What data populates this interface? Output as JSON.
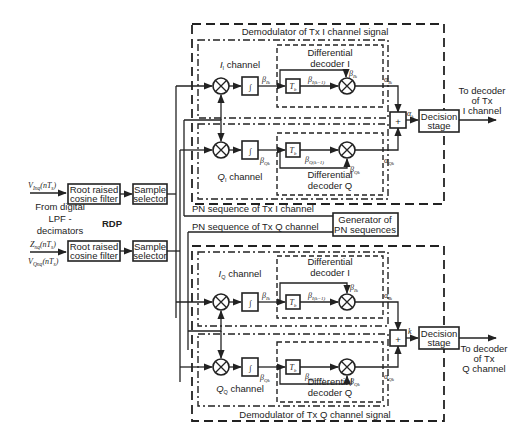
{
  "inputs": {
    "v_in": "V",
    "v_in_sub": "Inq",
    "v_in_arg": "(nT",
    "v_in_s": "s",
    "z_in": "Z",
    "z_in_sub": "nq",
    "v_q": "V",
    "v_q_sub": "Qnq",
    "source_line1": "From digital",
    "source_line2": "LPF -",
    "source_line3": "decimators"
  },
  "blocks": {
    "rrc_top_line1": "Root raised",
    "rrc_top_line2": "cosine filter",
    "rrc_bot_line1": "Root raised",
    "rrc_bot_line2": "cosine filter",
    "sel_top_line1": "Sample",
    "sel_top_line2": "selector",
    "sel_bot_line1": "Sample",
    "sel_bot_line2": "selector",
    "rdp": "RDP",
    "pn_gen_line1": "Generator of",
    "pn_gen_line2": "PN sequences",
    "decision_top_line1": "Decision",
    "decision_top_line2": "stage",
    "decision_bot_line1": "Decision",
    "decision_bot_line2": "stage",
    "delay": "T",
    "delay_sub": "b",
    "sum": "+"
  },
  "groups": {
    "demod_i": "Demodulator of Tx I channel signal",
    "demod_q": "Demodulator of Tx Q channel signal",
    "ii_channel": "I",
    "ii_channel_sub": "I",
    "ii_channel_rest": " channel",
    "qi_channel": "Q",
    "qi_channel_sub": "I",
    "qi_channel_rest": " channel",
    "iq_channel": "I",
    "iq_channel_sub": "Q",
    "iq_channel_rest": " channel",
    "qq_channel": "Q",
    "qq_channel_sub": "Q",
    "qq_channel_rest": " channel",
    "diff_dec_i_line1": "Differential",
    "diff_dec_i_line2": "decoder I",
    "diff_dec_q_line1": "Differential",
    "diff_dec_q_line2": "decoder Q",
    "pn_tx_i": "PN sequence  of Tx I channel",
    "pn_tx_q": "PN sequence  of Tx Q channel"
  },
  "outputs": {
    "to_i_line1": "To decoder",
    "to_i_line2": "of Tx",
    "to_i_line3": "I channel",
    "to_q_line1": "To decoder",
    "to_q_line2": "of Tx",
    "to_q_line3": "Q channel"
  },
  "signals": {
    "beta_ik": "β",
    "beta_ik_sub": "Ik",
    "beta_ik1_sub": "I(k−1)",
    "beta_qk_sub": "Qk",
    "beta_qk1_sub": "Q(k−1)",
    "alpha": "α",
    "alpha_ik_sub": "Ik",
    "alpha_qk_sub": "Qk",
    "alpha_k_sub": "k"
  }
}
